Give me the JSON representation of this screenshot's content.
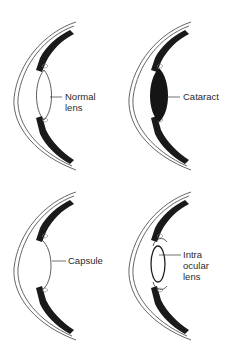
{
  "diagram": {
    "panels": [
      {
        "id": "normal",
        "label_lines": [
          "Normal",
          "lens"
        ],
        "lens_type": "clear-biconvex"
      },
      {
        "id": "cataract",
        "label_lines": [
          "Cataract"
        ],
        "lens_type": "opaque-filled"
      },
      {
        "id": "capsule",
        "label_lines": [
          "Capsule"
        ],
        "lens_type": "empty-capsule"
      },
      {
        "id": "iol",
        "label_lines": [
          "Intra",
          "ocular",
          "lens"
        ],
        "lens_type": "intraocular-implant"
      }
    ],
    "colors": {
      "ink": "#1a1a1a",
      "line": "#444444",
      "background": "#ffffff"
    }
  }
}
